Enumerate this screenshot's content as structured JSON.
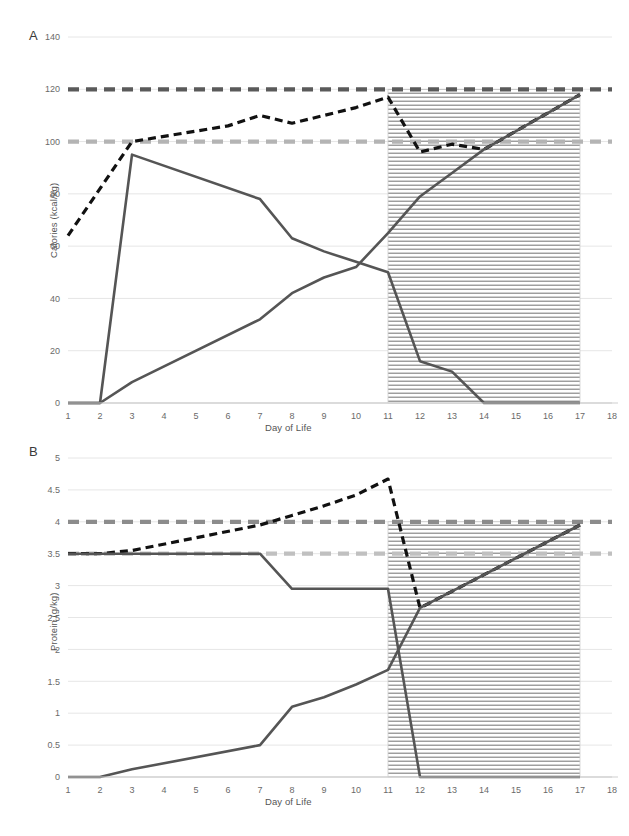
{
  "figure": {
    "background": "#ffffff",
    "width": 629,
    "height": 836
  },
  "panels": {
    "a": {
      "letter": "A",
      "xlabel": "Day of Life",
      "ylabel": "Calories (kcal/kg)"
    },
    "b": {
      "letter": "B",
      "xlabel": "Day of Life",
      "ylabel": "Protein (g/kg)"
    }
  },
  "colors": {
    "goal_upper": "#5a5a5a",
    "goal_lower": "#b4b4b4",
    "dashed_total": "#111111",
    "solid_line": "#555555",
    "gridline": "#e6e6e6",
    "axis": "#cfcfcf",
    "tick_text": "#6a6a6a",
    "shade_region": "#7d7d7d"
  },
  "chart_data": [
    {
      "id": "panel-a",
      "type": "line",
      "title": "A",
      "xlabel": "Day of Life",
      "ylabel": "Calories (kcal/kg)",
      "xlim": [
        1,
        18
      ],
      "ylim": [
        0,
        140
      ],
      "yticks": [
        0,
        20,
        40,
        60,
        80,
        100,
        120,
        140
      ],
      "ytick_labels": [
        "0",
        "20",
        "40",
        "60",
        "80",
        "100",
        "120",
        "140"
      ],
      "xticks": [
        1,
        2,
        3,
        4,
        5,
        6,
        7,
        8,
        9,
        10,
        11,
        12,
        13,
        14,
        15,
        16,
        17,
        18
      ],
      "xtick_labels": [
        "1",
        "2",
        "3",
        "4",
        "5",
        "6",
        "7",
        "8",
        "9",
        "10",
        "11",
        "12",
        "13",
        "14",
        "15",
        "16",
        "17",
        "18"
      ],
      "grid": true,
      "legend": "none",
      "shaded_region": {
        "x_start": 11,
        "x_end": 17,
        "y_top": 120,
        "y_bottom": 0,
        "hatch": "horizontal"
      },
      "series": [
        {
          "name": "Goal upper (120 kcal/kg)",
          "style": "dashed-thick",
          "color": "#5a5a5a",
          "x": [
            1,
            18
          ],
          "values": [
            120,
            120
          ]
        },
        {
          "name": "Goal lower (100 kcal/kg)",
          "style": "dashed-thick",
          "color": "#b4b4b4",
          "x": [
            1,
            18
          ],
          "values": [
            100,
            100
          ]
        },
        {
          "name": "Total calories",
          "style": "dashed-black",
          "color": "#111111",
          "x": [
            1,
            2,
            3,
            4,
            5,
            6,
            7,
            8,
            9,
            10,
            11,
            12,
            13,
            14,
            17
          ],
          "values": [
            64,
            82,
            100,
            102,
            104,
            106,
            110,
            107,
            110,
            113,
            117,
            96,
            99,
            97,
            118
          ]
        },
        {
          "name": "Parenteral nutrition calories",
          "style": "solid",
          "color": "#555555",
          "x": [
            1,
            2,
            3,
            7,
            8,
            9,
            10,
            11,
            12,
            13,
            14,
            17
          ],
          "values": [
            0,
            0,
            95,
            78,
            63,
            58,
            54,
            50,
            16,
            12,
            0,
            0
          ]
        },
        {
          "name": "Enteral nutrition calories",
          "style": "solid",
          "color": "#555555",
          "x": [
            1,
            2,
            3,
            7,
            8,
            9,
            10,
            11,
            12,
            13,
            14,
            17
          ],
          "values": [
            0,
            0,
            8,
            32,
            42,
            48,
            52,
            65,
            79,
            88,
            97,
            118
          ]
        }
      ]
    },
    {
      "id": "panel-b",
      "type": "line",
      "title": "B",
      "xlabel": "Day of Life",
      "ylabel": "Protein (g/kg)",
      "xlim": [
        1,
        18
      ],
      "ylim": [
        0,
        5
      ],
      "yticks": [
        0,
        0.5,
        1,
        1.5,
        2,
        2.5,
        3,
        3.5,
        4,
        4.5,
        5
      ],
      "ytick_labels": [
        "0",
        "0.5",
        "1",
        "1.5",
        "2",
        "2.5",
        "3",
        "3.5",
        "4",
        "4.5",
        "5"
      ],
      "xticks": [
        1,
        2,
        3,
        4,
        5,
        6,
        7,
        8,
        9,
        10,
        11,
        12,
        13,
        14,
        15,
        16,
        17,
        18
      ],
      "xtick_labels": [
        "1",
        "2",
        "3",
        "4",
        "5",
        "6",
        "7",
        "8",
        "9",
        "10",
        "11",
        "12",
        "13",
        "14",
        "15",
        "16",
        "17",
        "18"
      ],
      "grid": true,
      "legend": "none",
      "shaded_region": {
        "x_start": 11,
        "x_end": 17,
        "y_top": 4,
        "y_bottom": 0,
        "hatch": "horizontal"
      },
      "series": [
        {
          "name": "Goal upper (4 g/kg)",
          "style": "dashed-thick",
          "color": "#8c8c8c",
          "x": [
            1,
            18
          ],
          "values": [
            4,
            4
          ]
        },
        {
          "name": "Goal lower (3.5 g/kg)",
          "style": "dashed-thick",
          "color": "#c0c0c0",
          "x": [
            1,
            18
          ],
          "values": [
            3.5,
            3.5
          ]
        },
        {
          "name": "Total protein",
          "style": "dashed-black",
          "color": "#111111",
          "x": [
            1,
            2,
            3,
            7,
            8,
            9,
            10,
            11,
            12,
            17
          ],
          "values": [
            3.5,
            3.5,
            3.55,
            3.95,
            4.1,
            4.25,
            4.42,
            4.67,
            2.65,
            3.95
          ]
        },
        {
          "name": "Parenteral nutrition protein",
          "style": "solid",
          "color": "#555555",
          "x": [
            1,
            2,
            3,
            7,
            8,
            9,
            10,
            11,
            12,
            17
          ],
          "values": [
            3.5,
            3.5,
            3.5,
            3.5,
            2.95,
            2.95,
            2.95,
            2.95,
            0,
            0
          ]
        },
        {
          "name": "Enteral nutrition protein",
          "style": "solid",
          "color": "#555555",
          "x": [
            1,
            2,
            3,
            7,
            8,
            9,
            10,
            11,
            12,
            17
          ],
          "values": [
            0,
            0,
            0.12,
            0.5,
            1.1,
            1.25,
            1.45,
            1.68,
            2.65,
            3.95
          ]
        }
      ]
    }
  ]
}
